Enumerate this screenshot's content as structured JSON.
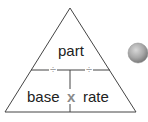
{
  "diagram": {
    "top_label": "part",
    "bottom_left_label": "base",
    "bottom_right_label": "rate",
    "multiply_symbol": "x",
    "divide_symbol_left": "÷",
    "divide_symbol_right": "÷"
  },
  "colors": {
    "line": "#444444",
    "text": "#222222",
    "operator_multiply": "#8a8a8a",
    "operator_divide": "#a0a0a0",
    "button_fill": "#a8a8a8"
  },
  "button": {
    "icon": "gray-circle-button"
  }
}
